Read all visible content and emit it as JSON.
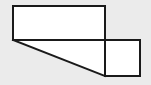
{
  "figure": {
    "canvas": {
      "width": 151,
      "height": 85,
      "background_color": "#ebebeb"
    },
    "style": {
      "stroke_color": "#1a1a1a",
      "stroke_width": 2,
      "fill_color": "#ffffff",
      "line_join": "miter"
    },
    "shapes": [
      {
        "name": "top-rectangle",
        "type": "rectangle",
        "x": 13,
        "y": 6,
        "width": 92,
        "height": 34,
        "points": [
          [
            13,
            6
          ],
          [
            105,
            6
          ],
          [
            105,
            40
          ],
          [
            13,
            40
          ]
        ]
      },
      {
        "name": "bottom-right-square",
        "type": "square",
        "x": 105,
        "y": 40,
        "width": 35,
        "height": 36,
        "points": [
          [
            105,
            40
          ],
          [
            140,
            40
          ],
          [
            140,
            76
          ],
          [
            105,
            76
          ]
        ]
      },
      {
        "name": "lower-left-triangle",
        "type": "triangle",
        "points": [
          [
            13,
            40
          ],
          [
            105,
            40
          ],
          [
            105,
            76
          ]
        ],
        "legs": {
          "horizontal": 92,
          "vertical": 36
        }
      }
    ],
    "segments": [
      {
        "name": "rect-top-edge",
        "from": [
          13,
          6
        ],
        "to": [
          105,
          6
        ]
      },
      {
        "name": "rect-left-edge",
        "from": [
          13,
          6
        ],
        "to": [
          13,
          40
        ]
      },
      {
        "name": "rect-right-edge",
        "from": [
          105,
          6
        ],
        "to": [
          105,
          40
        ]
      },
      {
        "name": "shared-horizontal-edge",
        "from": [
          13,
          40
        ],
        "to": [
          140,
          40
        ]
      },
      {
        "name": "diagonal-hypotenuse",
        "from": [
          13,
          40
        ],
        "to": [
          105,
          76
        ]
      },
      {
        "name": "square-right-edge",
        "from": [
          140,
          40
        ],
        "to": [
          140,
          76
        ]
      },
      {
        "name": "square-bottom-edge",
        "from": [
          105,
          76
        ],
        "to": [
          140,
          76
        ]
      },
      {
        "name": "square-left-edge",
        "from": [
          105,
          40
        ],
        "to": [
          105,
          76
        ]
      }
    ]
  }
}
